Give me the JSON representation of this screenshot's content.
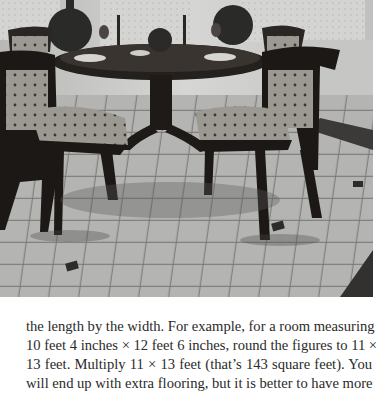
{
  "figure": {
    "colors": {
      "floor_light": "#b9b9b9",
      "floor_dark": "#7d7d7d",
      "grout": "#5a5a5a",
      "wood": "#1e1a18",
      "fabric": "#9a9690",
      "curtain": "#d8d8d6",
      "wall": "#c4c4c2"
    }
  },
  "body_text": {
    "lines": [
      "the length by the width. For example, for a room measuring",
      "10 feet 4 inches × 12 feet 6 inches, round the figures to 11 ×",
      "13 feet. Multiply 11 × 13 feet (that’s 143 square feet). You",
      "will end up with extra flooring, but it is better to have more"
    ]
  }
}
